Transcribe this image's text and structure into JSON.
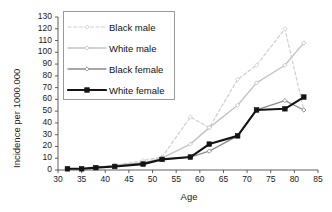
{
  "chart_data": {
    "type": "line",
    "title": "",
    "xlabel": "Age",
    "ylabel": "Incidence per 1000.000",
    "xlim": [
      30,
      85
    ],
    "ylim": [
      0,
      130
    ],
    "xticks": [
      30,
      35,
      40,
      45,
      50,
      55,
      60,
      65,
      70,
      75,
      80,
      85
    ],
    "yticks": [
      0,
      10,
      20,
      30,
      40,
      50,
      60,
      70,
      80,
      90,
      100,
      110,
      120,
      130
    ],
    "grid": false,
    "legend_position": "upper left inside",
    "x": [
      32,
      35,
      38,
      42,
      48,
      52,
      58,
      62,
      68,
      72,
      78,
      82
    ],
    "series": [
      {
        "name": "Black male",
        "color": "#cfcfcf",
        "style": "dashed",
        "marker": "diamond",
        "width": 1.2,
        "values": [
          1,
          1,
          2,
          4,
          8,
          11,
          45,
          36,
          77,
          89,
          120,
          51
        ]
      },
      {
        "name": "White male",
        "color": "#c4c4c4",
        "style": "solid",
        "marker": "diamond",
        "width": 1.4,
        "values": [
          1,
          1,
          2,
          4,
          6,
          10,
          22,
          36,
          55,
          74,
          89,
          108
        ]
      },
      {
        "name": "Black female",
        "color": "#8c8c8c",
        "style": "solid",
        "marker": "diamond",
        "width": 1.3,
        "values": [
          1,
          1,
          2,
          3,
          6,
          9,
          11,
          16,
          29,
          51,
          59,
          51
        ]
      },
      {
        "name": "White female",
        "color": "#141414",
        "style": "solid",
        "marker": "square",
        "width": 2.1,
        "values": [
          1,
          1,
          2,
          3,
          5,
          9,
          11,
          22,
          29,
          51,
          52,
          62
        ]
      }
    ]
  },
  "axis": {
    "x_title": "Age",
    "y_title": "Incidence per 1000.000",
    "y_tick_labels": [
      "130",
      "120",
      "110",
      "100",
      "90",
      "80",
      "70",
      "60",
      "50",
      "40",
      "30",
      "20",
      "10",
      "0"
    ],
    "x_tick_labels": [
      "30",
      "35",
      "40",
      "45",
      "50",
      "55",
      "60",
      "65",
      "70",
      "75",
      "80",
      "85"
    ]
  },
  "legend": {
    "items": [
      {
        "label": "Black male"
      },
      {
        "label": "White male"
      },
      {
        "label": "Black female"
      },
      {
        "label": "White female"
      }
    ]
  }
}
